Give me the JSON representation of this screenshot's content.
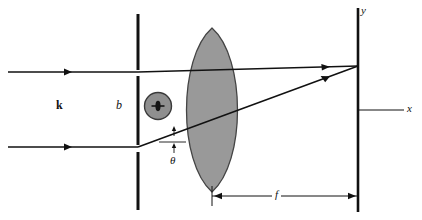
{
  "figure": {
    "background_color": "#ffffff",
    "ink_color": "#111111",
    "lens_fill_color": "#999999",
    "lens_stroke_color": "#444444",
    "aperture_disk_fill": "#8f8f8f",
    "aperture_disk_stroke": "#3a3a3a"
  },
  "labels": {
    "wavevector": "k",
    "slit_width": "b",
    "angle": "θ",
    "focal_length": "f",
    "axis_y": "y",
    "axis_x": "x",
    "aperture_symbol": "Ф"
  },
  "elements": {
    "barrier_name": "aperture-barrier",
    "lens_name": "converging-lens",
    "screen_name": "observation-screen",
    "incident_ray_upper": "incident-ray-upper",
    "incident_ray_lower": "incident-ray-lower",
    "diffracted_ray_upper": "diffracted-ray-upper",
    "diffracted_ray_lower": "diffracted-ray-lower",
    "dimension_line": "focal-length-dimension"
  },
  "geometry": {
    "barrier_x": 138,
    "lens_center_x": 212,
    "screen_x": 358,
    "optical_axis_y": 110,
    "upper_ray_y": 72,
    "lower_ray_y": 147,
    "focus_point_y": 66,
    "dimension_y": 196,
    "dimension_left_x": 212,
    "dimension_right_x": 358
  }
}
